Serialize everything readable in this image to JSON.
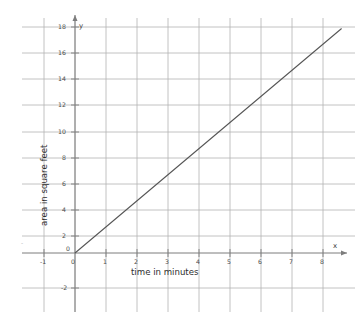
{
  "chart_data": {
    "type": "line",
    "title": "",
    "subtitle": "",
    "xlabel": "time in minutes",
    "ylabel": "area in square feet",
    "x_axis_name": "x",
    "y_axis_name": "y",
    "equation": "y = 2x",
    "slope": 2,
    "intercept": 0,
    "grid": true,
    "legend": "none",
    "xlim": [
      -1.5,
      8.6
    ],
    "ylim": [
      -3.0,
      18.6
    ],
    "x_ticks": [
      -1,
      0,
      1,
      2,
      3,
      4,
      5,
      6,
      7,
      8
    ],
    "x_tick_labels": [
      "-1",
      "0",
      "1",
      "2",
      "3",
      "4",
      "5",
      "6",
      "7",
      "8"
    ],
    "y_ticks": [
      -2,
      0,
      2,
      4,
      6,
      8,
      10,
      12,
      14,
      16,
      18
    ],
    "y_tick_labels": [
      "-2",
      "0",
      "2",
      "4",
      "6",
      "8",
      "10",
      "12",
      "14",
      "16",
      "18"
    ],
    "x_gridlines": [
      -1,
      0,
      1,
      2,
      3,
      4,
      5,
      6,
      7,
      8
    ],
    "y_gridlines": [
      -2,
      0,
      2,
      4,
      6,
      8,
      10,
      12,
      14,
      16,
      18
    ],
    "series": [
      {
        "name": "area",
        "x": [
          0,
          1,
          2,
          3,
          4,
          5,
          6,
          7,
          8,
          8.6
        ],
        "values": [
          0,
          2,
          4,
          6,
          8,
          10,
          12,
          14,
          16,
          17.2
        ]
      }
    ],
    "line_start": {
      "x": 0,
      "y": 0
    },
    "line_end": {
      "x": 8.6,
      "y": 17.2
    },
    "stray_mark": "-",
    "colors": {
      "background": "#ffffff",
      "gridline": "#b0b0b0",
      "axis": "#8c8c8c",
      "data_line": "#555555",
      "tick_text": "#4a4a4a",
      "title_text": "#2e2e2e"
    }
  }
}
